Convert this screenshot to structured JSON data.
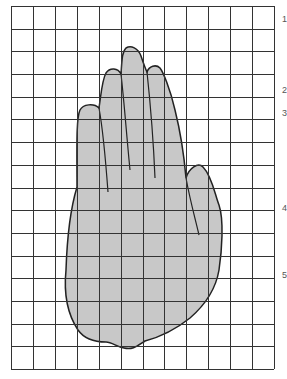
{
  "figure": {
    "grid": {
      "columns": 12,
      "rows": 16,
      "x0": 11,
      "y0": 6,
      "x1": 274,
      "y1": 369,
      "line_color": "#333333"
    },
    "hand": {
      "fill": "#c8c8c8",
      "stroke": "#222222"
    },
    "edge_labels": [
      {
        "text": "1",
        "y": 14
      },
      {
        "text": "2",
        "y": 85
      },
      {
        "text": "3",
        "y": 108
      },
      {
        "text": "4",
        "y": 203
      },
      {
        "text": "5",
        "y": 270
      }
    ]
  }
}
